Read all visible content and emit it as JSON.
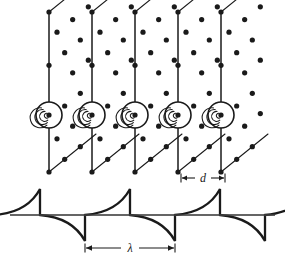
{
  "figure": {
    "kind": "physics-diagram",
    "background_color": "#ffffff",
    "ink_color": "#1a1a1a"
  },
  "labels": {
    "plane_spacing": "d",
    "wavelength": "λ"
  },
  "lattice": {
    "plane_count": 5,
    "plane_spacing_px": 43,
    "plane_first_left_edge_x": 49,
    "plane_top_y": 12,
    "plane_bottom_y": 172,
    "plane_slant_dx": 47,
    "plane_slant_dy": -38,
    "atom_dot_radius": 2.6,
    "atom_rows": 7,
    "atom_cols": 3,
    "source_circle_radius": 13,
    "source_circle_count": 5,
    "source_circle_center_y": 115,
    "source_circle_first_center_x": 49
  },
  "spacing_marker": {
    "label": "d",
    "x_start": 181,
    "x_end": 225,
    "y": 178,
    "tick_height": 9
  },
  "wave": {
    "baseline_y": 215,
    "baseline_x_start": 10,
    "baseline_x_end": 275,
    "wavelength_px": 90,
    "amplitude_px": 26,
    "crest_positions_x": [
      40,
      130,
      220
    ],
    "trough_positions_x": [
      85,
      175,
      265
    ],
    "shape": "cusped"
  },
  "wavelength_marker": {
    "label": "λ",
    "x_start": 85,
    "x_end": 175,
    "y": 248,
    "tick_height": 9
  },
  "icon_names": {
    "atom_dot": "atom-dot-icon",
    "wave_source": "wave-source-icon",
    "arrow_double": "double-headed-arrow-icon"
  }
}
